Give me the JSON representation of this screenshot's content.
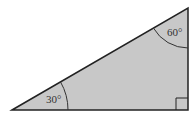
{
  "diagram": {
    "type": "right-triangle",
    "fill_color": "#c8c8c8",
    "stroke_color": "#222222",
    "vertices": {
      "left": [
        12,
        110
      ],
      "top_right": [
        188,
        8
      ],
      "bottom_right": [
        188,
        110
      ]
    },
    "angles": [
      {
        "vertex": "left",
        "label": "30°"
      },
      {
        "vertex": "top_right",
        "label": "60°"
      },
      {
        "vertex": "bottom_right",
        "label": "right-angle"
      }
    ]
  }
}
